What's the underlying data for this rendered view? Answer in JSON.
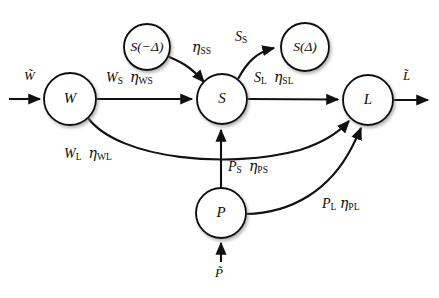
{
  "diagram": {
    "type": "flow-network-diagram",
    "background_color": "#ffffff",
    "stroke_color": "#111111",
    "nodes": [
      {
        "id": "W",
        "label": "W",
        "cx": 70,
        "cy": 99,
        "r": 26
      },
      {
        "id": "Sprev",
        "label": "S(−Δ)",
        "cx": 147,
        "cy": 47,
        "r": 23
      },
      {
        "id": "S",
        "label": "S",
        "cx": 222,
        "cy": 99,
        "r": 25
      },
      {
        "id": "Snext",
        "label": "S(Δ)",
        "cx": 305,
        "cy": 47,
        "r": 24
      },
      {
        "id": "L",
        "label": "L",
        "cx": 368,
        "cy": 100,
        "r": 25
      },
      {
        "id": "P",
        "label": "P",
        "cx": 221,
        "cy": 213,
        "r": 25
      }
    ],
    "io_labels": [
      {
        "id": "w-tilde",
        "text": "W̃",
        "x": 24,
        "y": 76
      },
      {
        "id": "l-tilde",
        "text": "L̃",
        "x": 403,
        "y": 76
      },
      {
        "id": "p-tilde",
        "text": "P̃",
        "x": 215,
        "y": 268
      }
    ],
    "edge_labels": [
      {
        "id": "ws",
        "flux": "W",
        "flux_sub": "S",
        "eta_sub": "WS",
        "x": 106,
        "y": 70
      },
      {
        "id": "sl",
        "flux": "S",
        "flux_sub": "L",
        "eta_sub": "SL",
        "x": 254,
        "y": 70
      },
      {
        "id": "wl",
        "flux": "W",
        "flux_sub": "L",
        "eta_sub": "WL",
        "x": 64,
        "y": 146
      },
      {
        "id": "ps",
        "flux": "P",
        "flux_sub": "S",
        "eta_sub": "PS",
        "x": 228,
        "y": 159
      },
      {
        "id": "pl",
        "flux": "P",
        "flux_sub": "L",
        "eta_sub": "PL",
        "x": 322,
        "y": 196
      },
      {
        "id": "ss_eta",
        "flux": "",
        "flux_sub": "",
        "eta_sub": "SS",
        "x": 192,
        "y": 40
      },
      {
        "id": "ss_flux",
        "flux": "S",
        "flux_sub": "S",
        "eta_sub": "",
        "x": 235,
        "y": 30
      }
    ],
    "edges": [
      {
        "id": "w-in",
        "from": "input",
        "to": "W",
        "style": "straight-arrow"
      },
      {
        "id": "w-to-s",
        "from": "W",
        "to": "S",
        "style": "straight-arrow"
      },
      {
        "id": "s-to-l",
        "from": "S",
        "to": "L",
        "style": "straight-arrow"
      },
      {
        "id": "l-out",
        "from": "L",
        "to": "output",
        "style": "straight-arrow"
      },
      {
        "id": "sprev-to-s",
        "from": "Sprev",
        "to": "S",
        "style": "curved-arrow"
      },
      {
        "id": "s-to-snext",
        "from": "S",
        "to": "Snext",
        "style": "curved-arrow"
      },
      {
        "id": "w-to-l",
        "from": "W",
        "to": "L",
        "style": "curved-arrow"
      },
      {
        "id": "p-to-s",
        "from": "P",
        "to": "S",
        "style": "straight-arrow"
      },
      {
        "id": "p-to-l",
        "from": "P",
        "to": "L",
        "style": "curved-arrow"
      },
      {
        "id": "p-in",
        "from": "input",
        "to": "P",
        "style": "straight-arrow"
      }
    ]
  }
}
